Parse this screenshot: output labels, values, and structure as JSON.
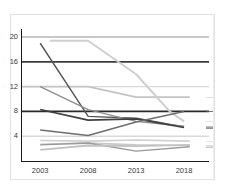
{
  "chart_data": {
    "type": "line",
    "title": "",
    "subtitle": "",
    "xlabel": "",
    "ylabel": "",
    "x": [
      2003,
      2008,
      2013,
      2018
    ],
    "xlim": [
      2001.0,
      2020.6
    ],
    "ylim": [
      0.0,
      21.3
    ],
    "xticks": [
      2003,
      2008,
      2013,
      2018
    ],
    "xticklabels": [
      "2003",
      "2008",
      "2013",
      "2018"
    ],
    "yticks": [
      4,
      8,
      12,
      16,
      20
    ],
    "yticklabels": [
      "4",
      "8",
      "12",
      "16",
      "20"
    ],
    "grid": true,
    "grid_color": "#d9d9d9",
    "gridlines_y": [
      4,
      12,
      20
    ],
    "legend": false,
    "legend_position": "none",
    "annotations": [],
    "series": [
      {
        "name": "series-1-flat-20",
        "color": "#bfbfbf",
        "width": 1.6,
        "x": [
          2001.0,
          2020.6
        ],
        "values": [
          20.0,
          20.0
        ]
      },
      {
        "name": "series-2-flat-16",
        "color": "#3c3c3c",
        "width": 1.6,
        "x": [
          2001.0,
          2020.6
        ],
        "values": [
          16.0,
          16.0
        ]
      },
      {
        "name": "series-3-step-12-to-10",
        "color": "#c4c4c4",
        "width": 1.8,
        "x": [
          2001.0,
          2008.0,
          2013.0,
          2018.6
        ],
        "values": [
          12.0,
          12.0,
          10.3,
          10.3
        ]
      },
      {
        "name": "series-4-flat-8",
        "color": "#2b2b2b",
        "width": 1.7,
        "x": [
          2001.0,
          2020.6
        ],
        "values": [
          8.0,
          8.0
        ]
      },
      {
        "name": "series-5-steep-decline-dark",
        "color": "#555555",
        "width": 1.4,
        "x": [
          2003.0,
          2008.0,
          2013.0,
          2018.0
        ],
        "values": [
          19.0,
          7.2,
          6.9,
          5.5
        ]
      },
      {
        "name": "series-6-plateau-then-drop",
        "color": "#cfcfcf",
        "width": 2.0,
        "x": [
          2004.0,
          2008.0,
          2013.0,
          2016.5,
          2018.0
        ],
        "values": [
          19.4,
          19.4,
          14.0,
          8.0,
          6.4
        ]
      },
      {
        "name": "series-7-decline-from-12",
        "color": "#8f8f8f",
        "width": 1.4,
        "x": [
          2003.0,
          2008.0,
          2013.0,
          2018.0
        ],
        "values": [
          12.0,
          8.3,
          6.4,
          5.6
        ]
      },
      {
        "name": "series-8-gentle-decline-dark",
        "color": "#3f3f3f",
        "width": 1.6,
        "x": [
          2003.0,
          2008.0,
          2013.0,
          2018.0
        ],
        "values": [
          8.3,
          6.6,
          6.8,
          5.4
        ]
      },
      {
        "name": "series-9-dip-then-rise",
        "color": "#6e6e6e",
        "width": 1.5,
        "x": [
          2003.0,
          2008.0,
          2013.0,
          2018.0
        ],
        "values": [
          5.0,
          4.1,
          6.3,
          8.0
        ]
      },
      {
        "name": "series-10-low-flat",
        "color": "#d0d0d0",
        "width": 1.6,
        "x": [
          2003.0,
          2008.0,
          2013.0,
          2018.6
        ],
        "values": [
          3.3,
          3.2,
          3.4,
          3.2
        ]
      },
      {
        "name": "series-11-low-bump",
        "color": "#c9c9c9",
        "width": 1.7,
        "x": [
          2003.0,
          2008.0,
          2013.0,
          2018.6
        ],
        "values": [
          2.7,
          2.9,
          2.6,
          2.5
        ]
      },
      {
        "name": "series-12-lowest-dip",
        "color": "#9a9a9a",
        "width": 1.4,
        "x": [
          2003.0,
          2008.0,
          2013.0,
          2018.6
        ],
        "values": [
          2.6,
          2.9,
          1.6,
          2.3
        ]
      },
      {
        "name": "series-13-bottom-rising",
        "color": "#c2c2c2",
        "width": 1.8,
        "x": [
          2003.0,
          2008.0,
          2013.0,
          2018.6
        ],
        "values": [
          1.8,
          2.5,
          2.4,
          2.6
        ]
      }
    ]
  },
  "axes": {
    "y_labels": [
      "20",
      "16",
      "12",
      "8",
      "4"
    ],
    "x_labels": [
      "2003",
      "2008",
      "2013",
      "2018"
    ]
  }
}
